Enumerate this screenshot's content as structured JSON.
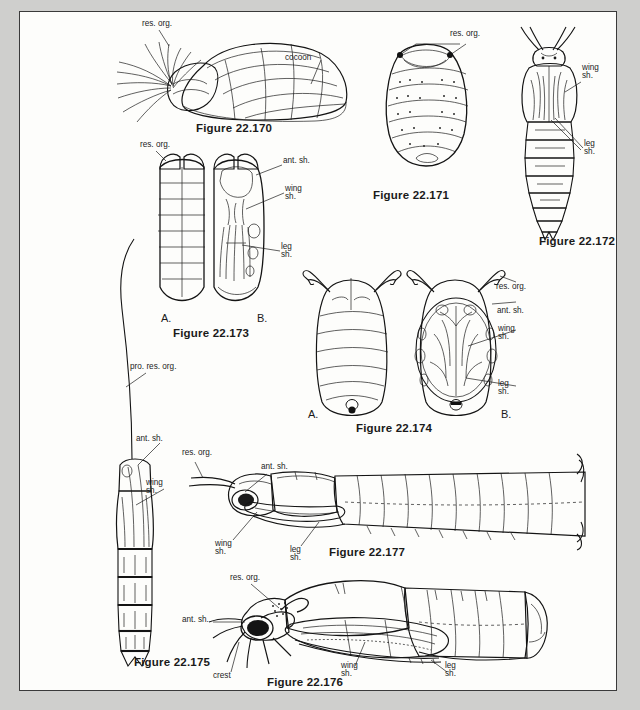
{
  "plate": {
    "title": "Insect pupae comparative plate",
    "background_color": "#cfcfcd",
    "page_color": "#fdfdfb",
    "border_color": "#3a3a3a"
  },
  "label_text": {
    "res_org": "res. org.",
    "pro_res_org": "pro. res. org.",
    "ant_sh": "ant. sh.",
    "wing_sh_line1": "wing",
    "wing_sh_line2": "sh.",
    "leg_sh_line1": "leg",
    "leg_sh_line2": "sh.",
    "cocoon": "cocoon",
    "crest": "crest",
    "panel_a": "A.",
    "panel_b": "B."
  },
  "figures": [
    {
      "id": "22-170",
      "caption": "Figure 22.170",
      "description": "Pupa enclosed in cocoon, lateral view, with long respiratory filaments",
      "labels": [
        "res. org.",
        "cocoon"
      ],
      "panels": []
    },
    {
      "id": "22-171",
      "caption": "Figure 22.171",
      "description": "Oval segmented pupa, dorsal view, stippled",
      "labels": [
        "res. org."
      ],
      "panels": []
    },
    {
      "id": "22-172",
      "caption": "Figure 22.172",
      "description": "Elongate pupa with long antennae, ventral view",
      "labels": [
        "wing sh.",
        "leg sh."
      ],
      "panels": []
    },
    {
      "id": "22-173",
      "caption": "Figure 22.173",
      "description": "Pupa dorsal (A) and ventral (B) views with paired respiratory organs",
      "labels": [
        "res. org.",
        "ant. sh.",
        "wing sh.",
        "leg sh."
      ],
      "panels": [
        "A.",
        "B."
      ]
    },
    {
      "id": "22-174",
      "caption": "Figure 22.174",
      "description": "Flattened pupa dorsal (A) and ventral (B) views with branched respiratory organs",
      "labels": [
        "res. org.",
        "ant. sh.",
        "wing sh.",
        "leg sh."
      ],
      "panels": [
        "A.",
        "B."
      ]
    },
    {
      "id": "22-175",
      "caption": "Figure 22.175",
      "description": "Slender elongate pupa with very long prothoracic respiratory organ",
      "labels": [
        "pro. res. org.",
        "ant. sh.",
        "wing sh."
      ],
      "panels": []
    },
    {
      "id": "22-176",
      "caption": "Figure 22.176",
      "description": "Robust pupa in lateral view with crest and respiratory organ",
      "labels": [
        "res. org.",
        "ant. sh.",
        "crest",
        "wing sh.",
        "leg sh."
      ],
      "panels": []
    },
    {
      "id": "22-177",
      "caption": "Figure 22.177",
      "description": "Long slender pupa in lateral view with many abdominal segments",
      "labels": [
        "res. org.",
        "ant. sh.",
        "wing sh.",
        "leg sh."
      ],
      "panels": []
    }
  ]
}
